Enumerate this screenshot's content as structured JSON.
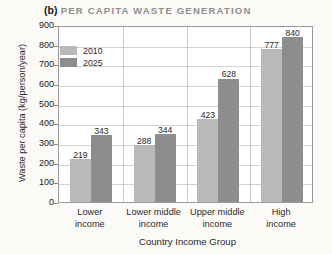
{
  "title": {
    "tag": "(b)",
    "text": "PER CAPITA WASTE GENERATION"
  },
  "legend": {
    "position": "top-left-inside",
    "entries": [
      {
        "label": "2010",
        "color": "#b9b9b9"
      },
      {
        "label": "2025",
        "color": "#8d8d8d"
      }
    ]
  },
  "chart_data": {
    "type": "bar",
    "xlabel": "Country Income Group",
    "ylabel": "Waste per capita (kg/person/year)",
    "categories": [
      "Lower income",
      "Lower middle income",
      "Upper middle income",
      "High income"
    ],
    "category_lines": [
      [
        "Lower",
        "income"
      ],
      [
        "Lower middle",
        "income"
      ],
      [
        "Upper middle",
        "income"
      ],
      [
        "High",
        "income"
      ]
    ],
    "series": [
      {
        "name": "2010",
        "color": "#b9b9b9",
        "values": [
          219,
          288,
          423,
          777
        ]
      },
      {
        "name": "2025",
        "color": "#8d8d8d",
        "values": [
          343,
          344,
          628,
          840
        ]
      }
    ],
    "ylim": [
      0,
      900
    ],
    "ytick_step": 100,
    "yticks": [
      900,
      800,
      700,
      600,
      500,
      400,
      300,
      200,
      100,
      0
    ],
    "grid": true,
    "grid_axis": "y",
    "data_labels": true,
    "legend_position": "top-left-inside"
  }
}
